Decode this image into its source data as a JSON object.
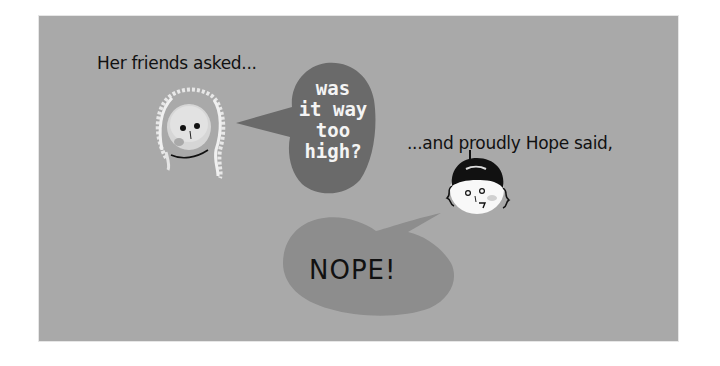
{
  "panel": {
    "background_color": "#a9a9a9",
    "caption_left": "Her friends asked...",
    "caption_right": "...and proudly Hope said,"
  },
  "friend_bubble": {
    "lines": [
      "was",
      "it way",
      "too",
      "high?"
    ],
    "color": "#6a6a6a",
    "text_color": "#f4f4f4"
  },
  "hope_bubble": {
    "text": "NOPE!",
    "color": "#8d8d8d",
    "text_color": "#111111"
  },
  "characters": {
    "friend": "curly-haired-girl-face",
    "hope": "dark-haired-girl-face"
  }
}
